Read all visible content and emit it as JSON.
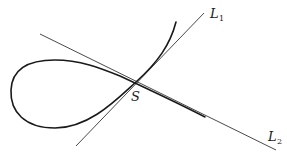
{
  "diagram": {
    "colors": {
      "background": "#ffffff",
      "stroke": "#1a1a1a"
    },
    "labels": {
      "point": "S",
      "line1_main": "L",
      "line1_sub": "1",
      "line2_main": "L",
      "line2_sub": "2"
    },
    "elements": [
      {
        "id": "curve",
        "type": "loop-curve",
        "label": ""
      },
      {
        "id": "L1",
        "type": "tangent-line",
        "label": "L1"
      },
      {
        "id": "L2",
        "type": "tangent-line",
        "label": "L2"
      },
      {
        "id": "S",
        "type": "point",
        "label": "S"
      }
    ]
  }
}
